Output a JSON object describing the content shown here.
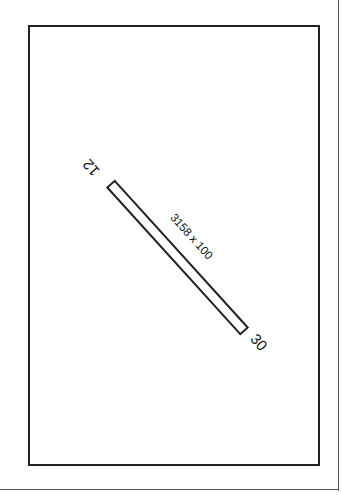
{
  "diagram": {
    "type": "airport-runway-diagram",
    "runway": {
      "end_a": {
        "designator": "12"
      },
      "end_b": {
        "designator": "30"
      },
      "dimensions_label": "3158 x 100",
      "length_ft": 3158,
      "width_ft": 100,
      "orientation_deg": 47
    },
    "colors": {
      "line": "#222222",
      "text": "#111111",
      "background": "#ffffff"
    }
  }
}
